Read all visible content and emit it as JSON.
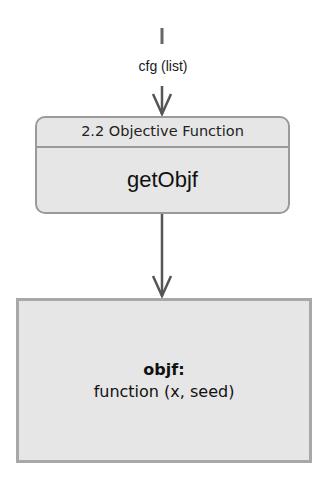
{
  "diagram": {
    "input": {
      "label": "cfg (list)"
    },
    "function_node": {
      "header": "2.2 Objective Function",
      "name": "getObjf"
    },
    "output_node": {
      "title": "objf:",
      "value": "function (x, seed)"
    },
    "colors": {
      "box_fill": "#e6e6e6",
      "box_border": "#9a9a9a",
      "arrow": "#555555"
    }
  }
}
